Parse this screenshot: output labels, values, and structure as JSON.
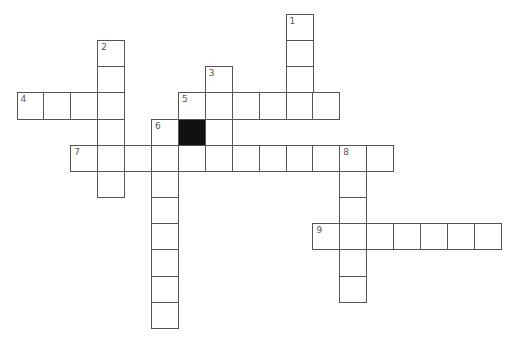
{
  "puzzle": {
    "cell_size": 26.9,
    "row_pitch": 26.15,
    "origin_x": 16.5,
    "origin_y": 14,
    "colors": {
      "line": "#555555",
      "block": "#111111",
      "number": "#555555",
      "background": "#ffffff"
    },
    "clues": [
      {
        "number": "1",
        "direction": "down",
        "row": 0,
        "col": 10,
        "length": 4
      },
      {
        "number": "2",
        "direction": "down",
        "row": 1,
        "col": 3,
        "length": 6
      },
      {
        "number": "3",
        "direction": "down",
        "row": 2,
        "col": 7,
        "length": 4
      },
      {
        "number": "4",
        "direction": "across",
        "row": 3,
        "col": 0,
        "length": 4
      },
      {
        "number": "5",
        "direction": "across",
        "row": 3,
        "col": 6,
        "length": 6
      },
      {
        "number": "6",
        "direction": "down",
        "row": 4,
        "col": 5,
        "length": 8
      },
      {
        "number": "7",
        "direction": "across",
        "row": 5,
        "col": 2,
        "length": 12
      },
      {
        "number": "8",
        "direction": "down",
        "row": 5,
        "col": 12,
        "length": 6
      },
      {
        "number": "9",
        "direction": "across",
        "row": 8,
        "col": 11,
        "length": 7
      }
    ],
    "blocks": [
      {
        "row": 4,
        "col": 6
      }
    ]
  }
}
